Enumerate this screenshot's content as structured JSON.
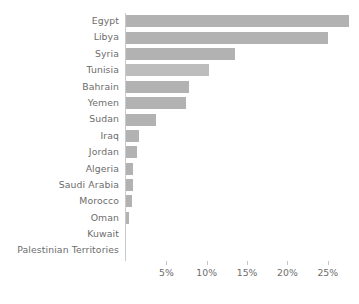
{
  "chart_data": {
    "type": "bar",
    "orientation": "horizontal",
    "title": "",
    "subtitle": "",
    "xlabel": "",
    "ylabel": "",
    "grid": false,
    "legend": null,
    "xlim": [
      0,
      27.6
    ],
    "xticks": [
      5,
      10,
      15,
      20,
      25
    ],
    "xtick_labels": [
      "5%",
      "10%",
      "15%",
      "20%",
      "25%"
    ],
    "categories": [
      "Egypt",
      "Libya",
      "Syria",
      "Tunisia",
      "Bahrain",
      "Yemen",
      "Sudan",
      "Iraq",
      "Jordan",
      "Algeria",
      "Saudi Arabia",
      "Morocco",
      "Oman",
      "Kuwait",
      "Palestinian Territories"
    ],
    "values": [
      27.6,
      25.0,
      13.5,
      10.3,
      7.8,
      7.4,
      3.7,
      1.6,
      1.4,
      0.9,
      0.85,
      0.8,
      0.4,
      0.0,
      0.0
    ],
    "bars": [
      {
        "label": "Egypt",
        "value": 27.6,
        "color": "#b2b2b2"
      },
      {
        "label": "Libya",
        "value": 25.0,
        "color": "#b2b2b2"
      },
      {
        "label": "Syria",
        "value": 13.5,
        "color": "#b2b2b2"
      },
      {
        "label": "Tunisia",
        "value": 10.3,
        "color": "#bdbdbd"
      },
      {
        "label": "Bahrain",
        "value": 7.8,
        "color": "#b2b2b2"
      },
      {
        "label": "Yemen",
        "value": 7.4,
        "color": "#b2b2b2"
      },
      {
        "label": "Sudan",
        "value": 3.7,
        "color": "#b2b2b2"
      },
      {
        "label": "Iraq",
        "value": 1.6,
        "color": "#b2b2b2"
      },
      {
        "label": "Jordan",
        "value": 1.4,
        "color": "#b2b2b2"
      },
      {
        "label": "Algeria",
        "value": 0.9,
        "color": "#b2b2b2"
      },
      {
        "label": "Saudi Arabia",
        "value": 0.85,
        "color": "#b2b2b2"
      },
      {
        "label": "Morocco",
        "value": 0.8,
        "color": "#b2b2b2"
      },
      {
        "label": "Oman",
        "value": 0.4,
        "color": "#b2b2b2"
      },
      {
        "label": "Kuwait",
        "value": 0.0,
        "color": "#b2b2b2"
      },
      {
        "label": "Palestinian Territories",
        "value": 0.0,
        "color": "#b2b2b2"
      }
    ],
    "colors": {
      "bar": "#b2b2b2",
      "bar_alt": "#bdbdbd",
      "axis": "#c9c9c9",
      "text": "#6d6d6d",
      "background": "#ffffff"
    }
  }
}
